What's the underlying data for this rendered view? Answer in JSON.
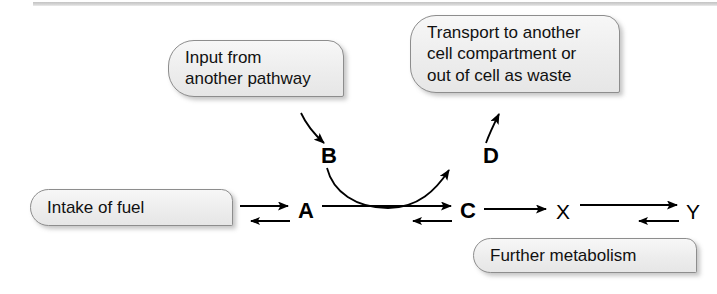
{
  "figure": {
    "type": "pathway-diagram",
    "background_color": "#ffffff",
    "box_fill_color": "#f1f1f1",
    "box_border_color": "#8d8d8d",
    "stroke_color": "#000000"
  },
  "callouts": [
    {
      "id": "input",
      "text": "Input from\nanother pathway",
      "lines": [
        "Input from",
        "another pathway"
      ]
    },
    {
      "id": "transport",
      "text": "Transport to another\ncell compartment or\nout of cell as waste",
      "lines": [
        "Transport to another",
        "cell compartment or",
        "out of cell as waste"
      ]
    },
    {
      "id": "intake",
      "text": "Intake of fuel",
      "lines": [
        "Intake of fuel"
      ]
    },
    {
      "id": "further",
      "text": "Further metabolism",
      "lines": [
        "Further metabolism"
      ]
    }
  ],
  "nodes": [
    {
      "id": "a",
      "label": "A",
      "emphasis": "bold"
    },
    {
      "id": "b",
      "label": "B",
      "emphasis": "bold"
    },
    {
      "id": "c",
      "label": "C",
      "emphasis": "bold"
    },
    {
      "id": "d",
      "label": "D",
      "emphasis": "bold"
    },
    {
      "id": "x",
      "label": "X",
      "emphasis": "plain"
    },
    {
      "id": "y",
      "label": "Y",
      "emphasis": "plain"
    }
  ],
  "arrows": [
    {
      "id": "intake-to-a",
      "kind": "reversible",
      "from": "Intake of fuel",
      "to": "A"
    },
    {
      "id": "a-to-c",
      "kind": "reversible",
      "from": "A",
      "to": "C"
    },
    {
      "id": "c-to-x",
      "kind": "single",
      "from": "C",
      "to": "X"
    },
    {
      "id": "x-to-y",
      "kind": "reversible",
      "from": "X",
      "to": "Y"
    },
    {
      "id": "input-to-b",
      "kind": "single-curved",
      "from": "Input from another pathway",
      "to": "B"
    },
    {
      "id": "b-to-d",
      "kind": "coupled-curve",
      "from": "B",
      "to": "D"
    },
    {
      "id": "d-to-transport",
      "kind": "single-curved",
      "from": "D",
      "to": "Transport to another cell compartment or out of cell as waste"
    }
  ]
}
